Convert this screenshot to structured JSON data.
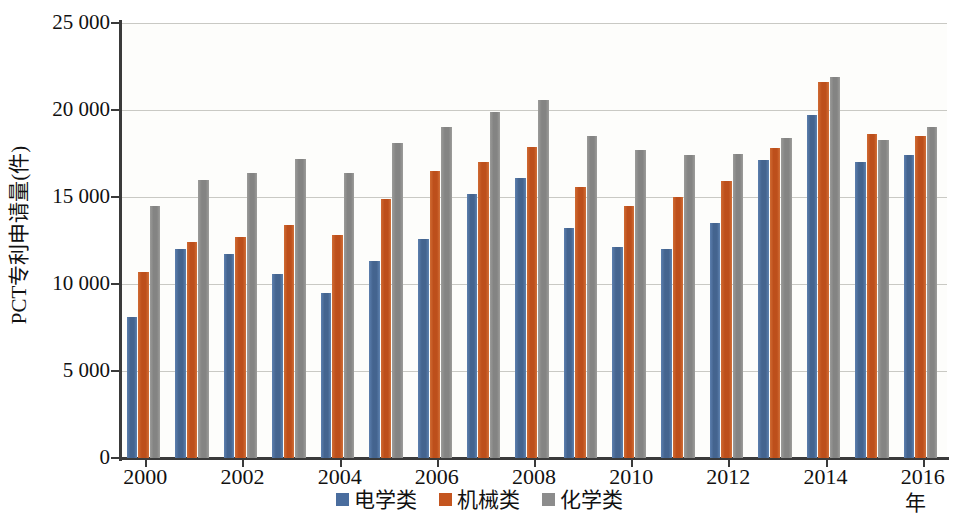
{
  "chart_data": {
    "type": "bar",
    "title": "",
    "subtitle": "",
    "xlabel": "年",
    "ylabel": "PCT专利申请量(件)",
    "categories": [
      "2000",
      "2001",
      "2002",
      "2003",
      "2004",
      "2005",
      "2006",
      "2007",
      "2008",
      "2009",
      "2010",
      "2011",
      "2012",
      "2013",
      "2014",
      "2015",
      "2016"
    ],
    "xtick_labels": [
      "2000",
      "2002",
      "2004",
      "2006",
      "2008",
      "2010",
      "2012",
      "2014",
      "2016"
    ],
    "ytick_labels": [
      "0",
      "5 000",
      "10 000",
      "15 000",
      "20 000",
      "25 000"
    ],
    "ytick_values": [
      0,
      5000,
      10000,
      15000,
      20000,
      25000
    ],
    "ylim": [
      0,
      25000
    ],
    "grid": true,
    "legend_position": "bottom-center",
    "series": [
      {
        "name": "电学类",
        "color": "#4a6d9e",
        "values": [
          8100,
          12000,
          11700,
          10600,
          9500,
          11300,
          12600,
          15200,
          16100,
          13200,
          12100,
          12000,
          13500,
          17100,
          19700,
          17000,
          17400
        ]
      },
      {
        "name": "机械类",
        "color": "#c4551f",
        "values": [
          10700,
          12400,
          12700,
          13400,
          12800,
          14900,
          16500,
          17000,
          17900,
          15600,
          14500,
          15000,
          15900,
          17800,
          21600,
          18600,
          18500
        ]
      },
      {
        "name": "化学类",
        "color": "#8c8c8c",
        "values": [
          14500,
          16000,
          16400,
          17200,
          16400,
          18100,
          19000,
          19900,
          20600,
          18500,
          17700,
          17400,
          17500,
          18400,
          21900,
          18300,
          19000
        ]
      }
    ]
  }
}
